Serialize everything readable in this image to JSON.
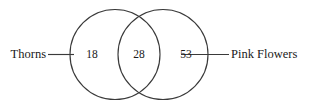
{
  "figure": {
    "type": "venn-diagram-2-set",
    "background_color": "#ffffff",
    "stroke_color": "#3a3a3a",
    "text_color": "#1a1a1a"
  },
  "sets": {
    "left": {
      "label": "Thorns",
      "only_count": "18"
    },
    "right": {
      "label": "Pink Flowers",
      "only_count": "53"
    },
    "intersection": {
      "count": "28"
    }
  }
}
